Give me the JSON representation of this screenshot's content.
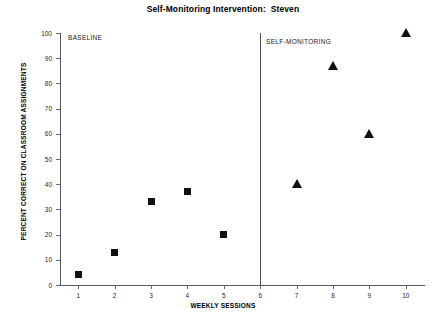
{
  "chart_data": {
    "type": "scatter",
    "title": "Self-Monitoring Intervention:  Steven",
    "xlabel": "WEEKLY SESSIONS",
    "ylabel": "PERCENT CORRECT ON CLASSROOM ASSIGNMENTS",
    "xlim": [
      0.5,
      10.5
    ],
    "ylim": [
      0,
      100
    ],
    "grid": false,
    "legend": "none",
    "x": [
      1,
      2,
      3,
      4,
      5,
      6,
      7,
      8,
      9,
      10
    ],
    "xticklabels": [
      "1",
      "2",
      "3",
      "4",
      "5",
      "6",
      "7",
      "8",
      "9",
      "10"
    ],
    "yticks": [
      0,
      10,
      20,
      30,
      40,
      50,
      60,
      70,
      80,
      90,
      100
    ],
    "yticklabels": [
      "0",
      "10",
      "20",
      "30",
      "40",
      "50",
      "60",
      "70",
      "80",
      "90",
      "100"
    ],
    "series": [
      {
        "name": "BASELINE",
        "marker": "square",
        "color": "#111111",
        "points": [
          {
            "x": 1,
            "y": 4
          },
          {
            "x": 2,
            "y": 13
          },
          {
            "x": 3,
            "y": 33
          },
          {
            "x": 4,
            "y": 37
          },
          {
            "x": 5,
            "y": 20
          }
        ]
      },
      {
        "name": "SELF-MONITORING",
        "marker": "triangle",
        "color": "#111111",
        "points": [
          {
            "x": 7,
            "y": 40
          },
          {
            "x": 8,
            "y": 87
          },
          {
            "x": 9,
            "y": 60
          },
          {
            "x": 10,
            "y": 100
          }
        ]
      }
    ],
    "annotations": [
      {
        "name": "phase-line",
        "type": "vline",
        "x": 6
      },
      {
        "name": "phase-label-baseline",
        "text": "BASELINE",
        "x": 1.3,
        "y": 99
      },
      {
        "name": "phase-label-intervention",
        "text": "SELF-MONITORING",
        "x": 6.3,
        "y": 97
      }
    ]
  },
  "labels": {
    "title": "Self-Monitoring Intervention:  Steven",
    "xlabel": "WEEKLY SESSIONS",
    "ylabel": "PERCENT CORRECT ON CLASSROOM ASSIGNMENTS",
    "phase_baseline": "BASELINE",
    "phase_intervention": "SELF-MONITORING"
  }
}
